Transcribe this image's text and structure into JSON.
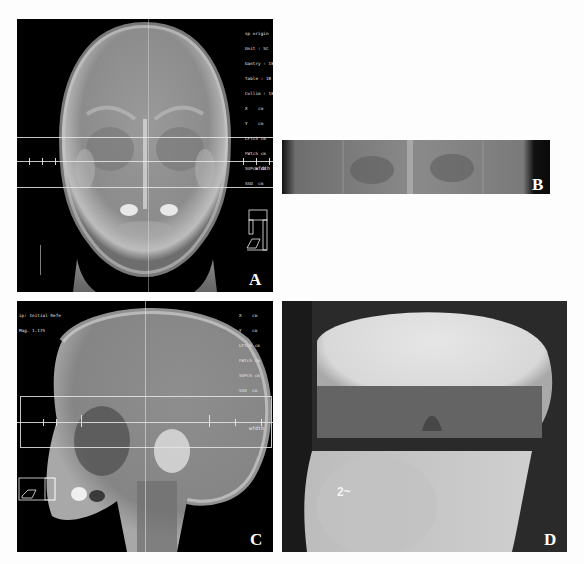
{
  "figure": {
    "panels": [
      {
        "id": "A",
        "label": "A",
        "view": "anteroposterior skull DRR",
        "overlay_lines": [
          "sp origin",
          "Unit : SC",
          "Gantry : 18",
          "Table : 18",
          "Collim : 18",
          "X    cm",
          "Y    cm",
          "LFtch cm",
          "FWtch cm",
          "SUPch cm",
          "SSD  cm"
        ],
        "scale_label": "wfdth"
      },
      {
        "id": "B",
        "label": "B",
        "view": "beam's eye strip (AP field)"
      },
      {
        "id": "C",
        "label": "C",
        "view": "lateral skull DRR",
        "header_lines": [
          "ip: Initial Refe",
          "Mag. 1.175"
        ],
        "overlay_lines": [
          "X    cm",
          "Y    cm",
          "LFtch cm",
          "FWtch cm",
          "SUPch cm",
          "SSD  cm"
        ],
        "scale_label": "wfdth"
      },
      {
        "id": "D",
        "label": "D",
        "view": "portal film (lateral field)"
      }
    ],
    "colors": {
      "background": "#fdfdfd",
      "panel_black": "#000000",
      "bone_light": "#d8d8d8",
      "soft_tissue": "#8a8a8a",
      "overlay": "#e8e8e8"
    }
  }
}
